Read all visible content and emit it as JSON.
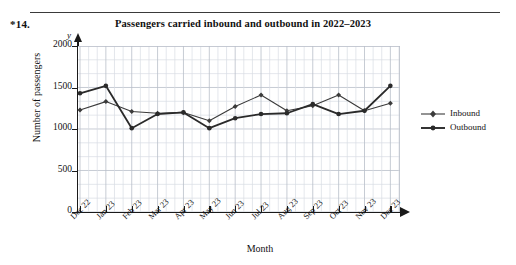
{
  "question": {
    "number": "*14."
  },
  "chart_data": {
    "type": "line",
    "title": "Passengers carried inbound and outbound in 2022–2023",
    "xlabel": "Month",
    "ylabel": "Number of passengers",
    "categories": [
      "Dec 22",
      "Jan 23",
      "Feb 23",
      "Mar 23",
      "Apr 23",
      "May 23",
      "Jun 23",
      "Jul 23",
      "Aug 23",
      "Sep 23",
      "Oct 23",
      "Nov 23",
      "Dec 23"
    ],
    "ylim": [
      0,
      2000
    ],
    "yticks": [
      0,
      500,
      1000,
      1500,
      2000
    ],
    "ytick_labels": [
      "0",
      "500",
      "1000",
      "1500",
      "2000"
    ],
    "grid": true,
    "grid_minor_y_step": 166.7,
    "grid_minor_x_per_interval": 2,
    "legend_position": "right",
    "series": [
      {
        "name": "Inbound",
        "marker": "diamond",
        "color": "#3b3b3b",
        "line_width": 1.1,
        "values": [
          1230,
          1330,
          1210,
          1190,
          1200,
          1100,
          1270,
          1410,
          1220,
          1280,
          1410,
          1220,
          1310
        ]
      },
      {
        "name": "Outbound",
        "marker": "circle",
        "color": "#2a2a2a",
        "line_width": 1.8,
        "values": [
          1430,
          1520,
          1010,
          1180,
          1200,
          1010,
          1130,
          1180,
          1190,
          1300,
          1180,
          1220,
          1520
        ]
      }
    ]
  }
}
